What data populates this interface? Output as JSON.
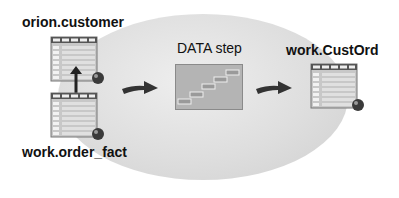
{
  "diagram": {
    "sources": [
      {
        "name": "orion.customer"
      },
      {
        "name": "work.order_fact"
      }
    ],
    "process": {
      "label": "DATA step"
    },
    "output": {
      "name": "work.CustOrd"
    }
  },
  "colors": {
    "background": "#ffffff",
    "blob": "#dcdcdc",
    "table_header": "#6a6a6a",
    "table_cell": "#cfcfcf",
    "arrow": "#333333",
    "process_box": "#b0b0b0"
  }
}
